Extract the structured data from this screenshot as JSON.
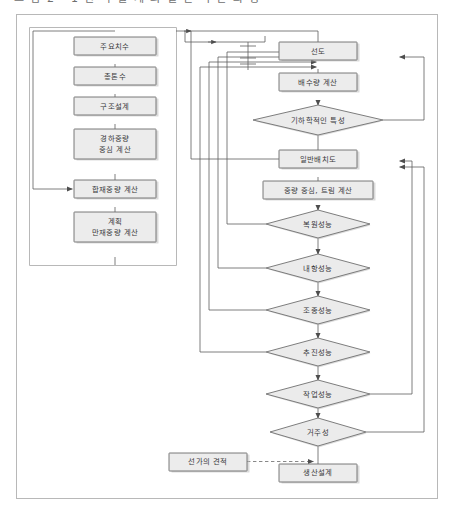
{
  "figure": {
    "caption_partial": "그  림  2 - 1  선 박 설 계 의  일 반 적 인  과 정",
    "frame_label": "figure-border",
    "colors": {
      "node_fill": "#ececec",
      "node_stroke": "#6b6b6b",
      "line": "#5d5d5d",
      "frame": "#b8b8b8",
      "text": "#39393b"
    }
  },
  "left_column": {
    "title": "초기설계 계산 흐름",
    "nodes": [
      {
        "id": "main-dimensions",
        "label": "주요치수",
        "shape": "rect",
        "x": 115,
        "y": 46,
        "w": 82,
        "h": 18
      },
      {
        "id": "gross-tonnage",
        "label": "총톤수",
        "shape": "rect",
        "x": 115,
        "y": 76,
        "w": 82,
        "h": 18
      },
      {
        "id": "structural-design",
        "label": "구조설계",
        "shape": "rect",
        "x": 115,
        "y": 106,
        "w": 82,
        "h": 18
      },
      {
        "id": "lightweight-center",
        "label_line1": "경하중량",
        "label_line2": "중심 계산",
        "shape": "rect",
        "x": 115,
        "y": 144,
        "w": 82,
        "h": 30
      },
      {
        "id": "deadweight-calc",
        "label": "합재중량 계산",
        "shape": "rect",
        "x": 115,
        "y": 189,
        "w": 82,
        "h": 18
      },
      {
        "id": "planned-full-load",
        "label_line1": "계획",
        "label_line2": "만재중량 계산",
        "shape": "rect",
        "x": 115,
        "y": 227,
        "w": 82,
        "h": 30
      }
    ]
  },
  "right_column": {
    "title": "선형 및 성능 검토 흐름",
    "nodes": [
      {
        "id": "lines-plan",
        "label": "선도",
        "shape": "rect",
        "x": 318,
        "y": 51,
        "w": 78,
        "h": 18
      },
      {
        "id": "displacement-calc",
        "label": "배수량 계산",
        "shape": "rect",
        "x": 318,
        "y": 82,
        "w": 78,
        "h": 18
      },
      {
        "id": "geometric-properties",
        "label": "기하학적인 특성",
        "shape": "diamond",
        "x": 318,
        "y": 120,
        "w": 130,
        "h": 30
      },
      {
        "id": "general-arrangement",
        "label": "일반배치도",
        "shape": "rect",
        "x": 318,
        "y": 159,
        "w": 78,
        "h": 18
      },
      {
        "id": "weight-center-trim",
        "label": "중량 중심, 트림 계산",
        "shape": "rect",
        "x": 318,
        "y": 190,
        "w": 110,
        "h": 18
      },
      {
        "id": "stability-performance",
        "label": "복원성능",
        "shape": "diamond",
        "x": 318,
        "y": 224,
        "w": 104,
        "h": 28
      },
      {
        "id": "seakeeping-performance",
        "label": "내항성능",
        "shape": "diamond",
        "x": 318,
        "y": 268,
        "w": 104,
        "h": 28
      },
      {
        "id": "maneuvering-performance",
        "label": "조종성능",
        "shape": "diamond",
        "x": 318,
        "y": 310,
        "w": 104,
        "h": 28
      },
      {
        "id": "propulsion-performance",
        "label": "추진성능",
        "shape": "diamond",
        "x": 318,
        "y": 352,
        "w": 104,
        "h": 28
      },
      {
        "id": "work-performance",
        "label": "작업성능",
        "shape": "diamond",
        "x": 318,
        "y": 394,
        "w": 104,
        "h": 28
      },
      {
        "id": "habitability",
        "label": "거주성",
        "shape": "diamond",
        "x": 318,
        "y": 432,
        "w": 96,
        "h": 28
      },
      {
        "id": "production-design",
        "label": "생산설계",
        "shape": "rect",
        "x": 318,
        "y": 473,
        "w": 78,
        "h": 18
      }
    ]
  },
  "side_nodes": [
    {
      "id": "ship-price-estimate",
      "label": "선가의 견적",
      "shape": "rect",
      "x": 208,
      "y": 452,
      "w": 78,
      "h": 18
    }
  ],
  "connections": {
    "description": "좌측 열 순차 연결, 성능 검토 다이어그램의 반복 피드백 루프",
    "dashed_links": [
      {
        "from": "ship-price-estimate",
        "to": "production-design",
        "style": "dashed"
      }
    ],
    "feedback_to_lines_plan": [
      "stability-performance",
      "seakeeping-performance",
      "maneuvering-performance",
      "propulsion-performance",
      "geometric-properties"
    ],
    "feedback_to_general_arrangement": [
      "work-performance",
      "habitability"
    ]
  }
}
